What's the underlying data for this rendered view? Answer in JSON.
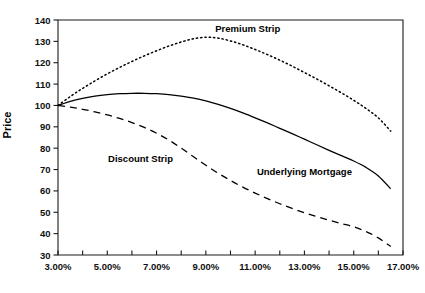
{
  "chart_data": {
    "type": "line",
    "title": "",
    "xlabel": "",
    "ylabel": "Price",
    "xlim": [
      3.0,
      17.0
    ],
    "ylim": [
      30,
      140
    ],
    "grid": false,
    "legend_position": "inline-annotations",
    "x_tick_labels": [
      "3.00%",
      "5.00%",
      "7.00%",
      "9.00%",
      "11.00%",
      "13.00%",
      "15.00%",
      "17.00%"
    ],
    "x_tick_values": [
      3.0,
      5.0,
      7.0,
      9.0,
      11.0,
      13.0,
      15.0,
      17.0
    ],
    "x_minor_tick_values": [
      4.0,
      6.0,
      8.0,
      10.0,
      12.0,
      14.0,
      16.0
    ],
    "y_tick_labels": [
      "30",
      "40",
      "50",
      "60",
      "70",
      "80",
      "90",
      "100",
      "110",
      "120",
      "130",
      "140"
    ],
    "y_tick_values": [
      30,
      40,
      50,
      60,
      70,
      80,
      90,
      100,
      110,
      120,
      130,
      140
    ],
    "x": [
      3.0,
      3.5,
      4.0,
      4.5,
      5.0,
      5.5,
      6.0,
      6.5,
      7.0,
      7.5,
      8.0,
      8.5,
      9.0,
      9.5,
      10.0,
      10.5,
      11.0,
      11.5,
      12.0,
      12.5,
      13.0,
      13.5,
      14.0,
      14.5,
      15.0,
      15.5,
      16.0,
      16.5
    ],
    "series": [
      {
        "name": "Premium Strip",
        "style": "dotted",
        "label_x": 10.7,
        "label_y": 134.5,
        "values": [
          100.0,
          104.2,
          108.0,
          111.5,
          114.8,
          117.8,
          120.6,
          123.2,
          125.6,
          127.8,
          129.7,
          131.2,
          131.9,
          131.5,
          130.2,
          128.4,
          126.2,
          123.8,
          121.2,
          118.4,
          115.4,
          112.4,
          109.2,
          105.9,
          102.4,
          98.6,
          94.2,
          88.0
        ]
      },
      {
        "name": "Underlying Mortgage",
        "style": "solid",
        "label_x": 13.0,
        "label_y": 67.5,
        "values": [
          100.0,
          101.9,
          103.3,
          104.4,
          105.1,
          105.5,
          105.7,
          105.7,
          105.5,
          105.1,
          104.4,
          103.4,
          102.1,
          100.5,
          98.6,
          96.5,
          94.2,
          91.8,
          89.3,
          86.8,
          84.2,
          81.6,
          79.0,
          76.5,
          74.0,
          71.0,
          67.0,
          61.0
        ]
      },
      {
        "name": "Discount Strip",
        "style": "dashed",
        "label_x": 6.35,
        "label_y": 73.5,
        "values": [
          100.0,
          99.2,
          98.2,
          97.0,
          95.6,
          93.9,
          92.0,
          89.7,
          87.0,
          83.8,
          80.0,
          76.0,
          72.0,
          68.3,
          64.9,
          61.8,
          59.0,
          56.4,
          54.0,
          51.8,
          49.8,
          48.0,
          46.3,
          44.7,
          43.2,
          41.0,
          38.0,
          34.0
        ]
      }
    ]
  }
}
